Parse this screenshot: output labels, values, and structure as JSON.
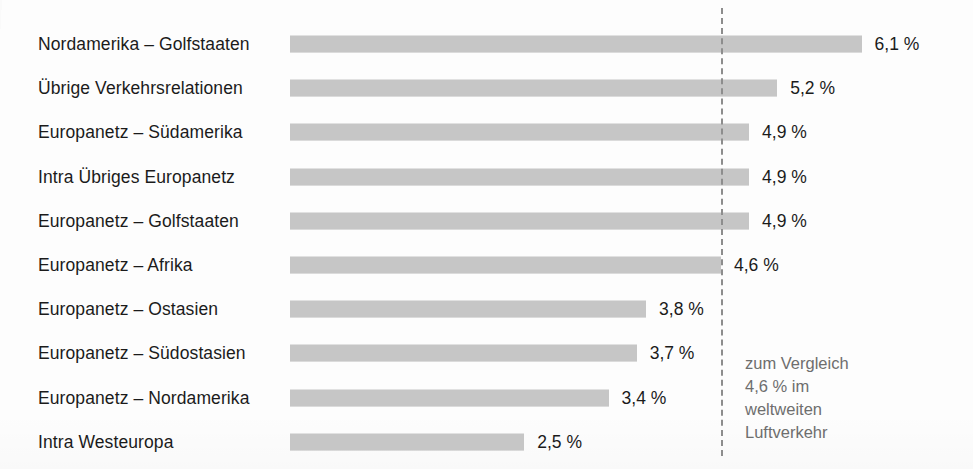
{
  "chart_data": {
    "type": "bar",
    "orientation": "horizontal",
    "title": "",
    "subtitle": "",
    "xlabel": "",
    "ylabel": "",
    "xlim": [
      0,
      7.25
    ],
    "grid": false,
    "legend": null,
    "value_suffix": " %",
    "decimal_separator": ",",
    "categories": [
      "Nordamerika – Golfstaaten",
      "Übrige Verkehrsrelationen",
      "Europanetz – Südamerika",
      "Intra Übriges Europanetz",
      "Europanetz – Golfstaaten",
      "Europanetz – Afrika",
      "Europanetz – Ostasien",
      "Europanetz – Südostasien",
      "Europanetz – Nordamerika",
      "Intra Westeuropa"
    ],
    "values": [
      6.1,
      5.2,
      4.9,
      4.9,
      4.9,
      4.6,
      3.8,
      3.7,
      3.4,
      2.5
    ],
    "value_labels": [
      "6,1 %",
      "5,2 %",
      "4,9 %",
      "4,9 %",
      "4,9 %",
      "4,6 %",
      "3,8 %",
      "3,7 %",
      "3,4 %",
      "2,5 %"
    ],
    "bar_color": "#c6c6c6",
    "label_color": "#1b1b1b",
    "reference_line": {
      "value": 4.6,
      "style": "dashed",
      "color": "#8d8d8d",
      "note_lines": [
        "zum Vergleich",
        "4,6 % im",
        "weltweiten",
        "Luftverkehr"
      ],
      "note_color": "#6e6e6e"
    }
  }
}
